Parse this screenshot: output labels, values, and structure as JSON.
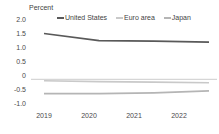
{
  "chart_data": {
    "type": "line",
    "title": "",
    "ylabel": "Percent",
    "xlabel": "",
    "categories": [
      "2019",
      "2020",
      "2021",
      "2022"
    ],
    "x": [
      2019,
      2020,
      2021,
      2022
    ],
    "ylim": [
      -1.0,
      2.0
    ],
    "yticks": [
      "2.0",
      "1.5",
      "1.0",
      "0.5",
      "0",
      "-0.5",
      "-1.0"
    ],
    "ytick_values": [
      2.0,
      1.5,
      1.0,
      0.5,
      0,
      -0.5,
      -1.0
    ],
    "grid": false,
    "zero_line": true,
    "legend_position": "top",
    "series": [
      {
        "name": "United States",
        "color": "#595959",
        "values": [
          1.6,
          1.35,
          1.33,
          1.3
        ]
      },
      {
        "name": "Euro area",
        "color": "#c9c9c9",
        "values": [
          -0.05,
          -0.08,
          -0.1,
          -0.12
        ]
      },
      {
        "name": "Japan",
        "color": "#b5b5b5",
        "values": [
          -0.5,
          -0.5,
          -0.47,
          -0.4
        ]
      }
    ]
  },
  "axis": {
    "ylabel": "Percent",
    "yticks": [
      {
        "label": "2.0"
      },
      {
        "label": "1.5"
      },
      {
        "label": "1.0"
      },
      {
        "label": "0.5"
      },
      {
        "label": "0"
      },
      {
        "label": "-0.5"
      },
      {
        "label": "-1.0"
      }
    ],
    "xticks": [
      {
        "label": "2019"
      },
      {
        "label": "2020"
      },
      {
        "label": "2021"
      },
      {
        "label": "2022"
      }
    ]
  },
  "legend": {
    "items": [
      {
        "label": "United States",
        "color": "#595959"
      },
      {
        "label": "Euro area",
        "color": "#c9c9c9"
      },
      {
        "label": "Japan",
        "color": "#b5b5b5"
      }
    ]
  }
}
